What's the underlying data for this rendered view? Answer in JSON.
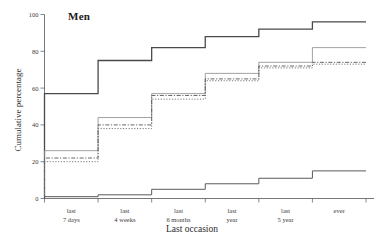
{
  "chart_data": {
    "type": "line",
    "title": "Men",
    "xlabel": "Last occasion",
    "ylabel": "Cumulative percentage",
    "categories": [
      "last\n7 days",
      "last\n4 weeks",
      "last\n6 months",
      "last\nyear",
      "last\n5 year",
      "ever"
    ],
    "category_lines": [
      [
        "last",
        "7 days"
      ],
      [
        "last",
        "4 weeks"
      ],
      [
        "last",
        "6 months"
      ],
      [
        "last",
        "year"
      ],
      [
        "last",
        "5 year"
      ],
      [
        "ever",
        ""
      ]
    ],
    "ylim": [
      0,
      100
    ],
    "xlim": [
      0,
      6
    ],
    "yticks": [
      0,
      20,
      40,
      60,
      80,
      100
    ],
    "ytick_labels": [
      "0",
      "20",
      "40",
      "60",
      "80",
      "100"
    ],
    "grid": false,
    "legend": "none",
    "step_style": "post",
    "series": [
      {
        "name": "series-1",
        "style": "solid",
        "color": "#4a4a4a",
        "width": 1.3,
        "values": [
          57,
          75,
          82,
          88,
          92,
          96
        ]
      },
      {
        "name": "series-2",
        "style": "solid",
        "color": "#8a8a8a",
        "width": 0.8,
        "values": [
          26,
          44,
          57,
          68,
          74,
          82
        ]
      },
      {
        "name": "series-3",
        "style": "dash-dot",
        "color": "#555555",
        "width": 0.9,
        "values": [
          22,
          40,
          56,
          65,
          72,
          74
        ]
      },
      {
        "name": "series-4",
        "style": "dotted",
        "color": "#6a6a6a",
        "width": 0.9,
        "values": [
          20,
          38,
          54,
          64,
          71,
          73
        ]
      },
      {
        "name": "series-5",
        "style": "solid",
        "color": "#5a5a5a",
        "width": 1.0,
        "values": [
          1,
          2,
          5,
          8,
          11,
          15
        ]
      }
    ]
  }
}
